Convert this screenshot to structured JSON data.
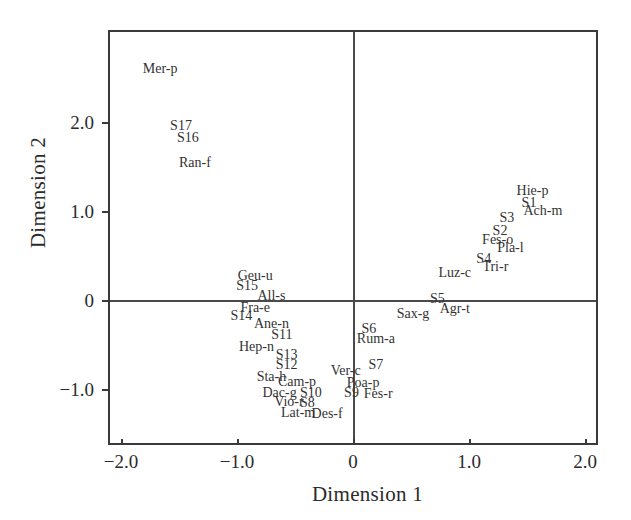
{
  "chart_data": {
    "type": "scatter",
    "title": "",
    "subtitle": "",
    "xlabel": "Dimension 1",
    "ylabel": "Dimension 2",
    "xlim": [
      -2.25,
      2.0
    ],
    "ylim": [
      -1.45,
      2.85
    ],
    "xticks": [
      -2.0,
      -1.0,
      0,
      1.0,
      2.0
    ],
    "xticklabels": [
      "−2.0",
      "−1.0",
      "0",
      "1.0",
      "2.0"
    ],
    "yticks": [
      -1.0,
      0,
      1.0,
      2.0
    ],
    "yticklabels": [
      "−1.0",
      "0",
      "1.0",
      "2.0"
    ],
    "grid": false,
    "legend": null,
    "marker_style": "text-label-only",
    "zero_lines": true,
    "axis_color": "#3a3a3a",
    "label_color": "#333333",
    "background": "#ffffff",
    "points": [
      {
        "label": "Mer-p",
        "x": -1.68,
        "y": 2.62
      },
      {
        "label": "S17",
        "x": -1.5,
        "y": 1.98
      },
      {
        "label": "S16",
        "x": -1.44,
        "y": 1.84
      },
      {
        "label": "Ran-f",
        "x": -1.38,
        "y": 1.56
      },
      {
        "label": "Hie-p",
        "x": 1.53,
        "y": 1.25
      },
      {
        "label": "S1",
        "x": 1.5,
        "y": 1.11
      },
      {
        "label": "Ach-m",
        "x": 1.62,
        "y": 1.02
      },
      {
        "label": "S3",
        "x": 1.31,
        "y": 0.94
      },
      {
        "label": "S2",
        "x": 1.25,
        "y": 0.8
      },
      {
        "label": "Fes-o",
        "x": 1.23,
        "y": 0.7
      },
      {
        "label": "Pla-l",
        "x": 1.34,
        "y": 0.61
      },
      {
        "label": "S4",
        "x": 1.11,
        "y": 0.48
      },
      {
        "label": "Tri-r",
        "x": 1.21,
        "y": 0.39
      },
      {
        "label": "Luz-c",
        "x": 0.86,
        "y": 0.33
      },
      {
        "label": "S5",
        "x": 0.71,
        "y": 0.03
      },
      {
        "label": "Agr-t",
        "x": 0.86,
        "y": -0.08
      },
      {
        "label": "Sax-g",
        "x": 0.5,
        "y": -0.14
      },
      {
        "label": "Geu-u",
        "x": -0.86,
        "y": 0.29
      },
      {
        "label": "S15",
        "x": -0.93,
        "y": 0.18
      },
      {
        "label": "All-s",
        "x": -0.72,
        "y": 0.07
      },
      {
        "label": "Fra-e",
        "x": -0.86,
        "y": -0.07
      },
      {
        "label": "S14",
        "x": -0.98,
        "y": -0.16
      },
      {
        "label": "Ane-n",
        "x": -0.72,
        "y": -0.25
      },
      {
        "label": "S11",
        "x": -0.63,
        "y": -0.37
      },
      {
        "label": "S6",
        "x": 0.12,
        "y": -0.3
      },
      {
        "label": "Rum-a",
        "x": 0.18,
        "y": -0.42
      },
      {
        "label": "Hep-n",
        "x": -0.85,
        "y": -0.5
      },
      {
        "label": "S13",
        "x": -0.59,
        "y": -0.6
      },
      {
        "label": "S12",
        "x": -0.59,
        "y": -0.71
      },
      {
        "label": "S7",
        "x": 0.18,
        "y": -0.71
      },
      {
        "label": "Ver-c",
        "x": -0.08,
        "y": -0.78
      },
      {
        "label": "Sta-h",
        "x": -0.72,
        "y": -0.84
      },
      {
        "label": "Cam-p",
        "x": -0.5,
        "y": -0.9
      },
      {
        "label": "Poa-p",
        "x": 0.07,
        "y": -0.91
      },
      {
        "label": "Dac-g",
        "x": -0.65,
        "y": -1.02
      },
      {
        "label": "S10",
        "x": -0.38,
        "y": -1.02
      },
      {
        "label": "S9",
        "x": -0.03,
        "y": -1.02
      },
      {
        "label": "Fes-r",
        "x": 0.2,
        "y": -1.03
      },
      {
        "label": "Vio-r",
        "x": -0.57,
        "y": -1.12
      },
      {
        "label": "S8",
        "x": -0.41,
        "y": -1.14
      },
      {
        "label": "Lat-m",
        "x": -0.49,
        "y": -1.25
      },
      {
        "label": "Des-f",
        "x": -0.24,
        "y": -1.26
      }
    ]
  }
}
